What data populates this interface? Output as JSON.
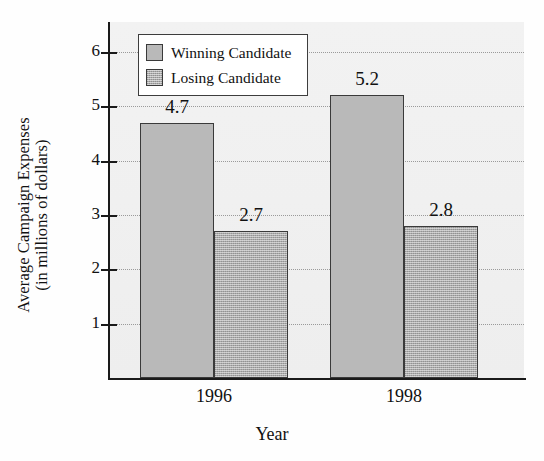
{
  "chart_data": {
    "type": "bar",
    "title": "",
    "xlabel": "Year",
    "ylabel_lines": [
      "Average Campaign Expenses",
      "(in millions of dollars)"
    ],
    "ylabel": "Average Campaign Expenses (in millions of dollars)",
    "categories": [
      "1996",
      "1998"
    ],
    "series": [
      {
        "name": "Winning Candidate",
        "values": [
          4.7,
          5.2
        ],
        "color": "#b9b9b9",
        "pattern": "solid"
      },
      {
        "name": "Losing Candidate",
        "values": [
          2.7,
          2.8
        ],
        "color": "#ababab",
        "pattern": "dither"
      }
    ],
    "value_labels": [
      "4.7",
      "2.7",
      "5.2",
      "2.8"
    ],
    "yticks": [
      1,
      2,
      3,
      4,
      5,
      6
    ],
    "ytick_labels": [
      "1",
      "2",
      "3",
      "4",
      "5",
      "6"
    ],
    "ylim": [
      0,
      6.55
    ],
    "grid": true,
    "grid_style": "dotted",
    "legend_position": "top-left-inside",
    "legend": [
      {
        "label": "Winning Candidate",
        "swatch": "win"
      },
      {
        "label": "Losing Candidate",
        "swatch": "lose"
      }
    ],
    "plot_background": "#f0f0f0",
    "axis_color": "#1a1a1a",
    "bar_border_color": "#3a3a3a"
  }
}
